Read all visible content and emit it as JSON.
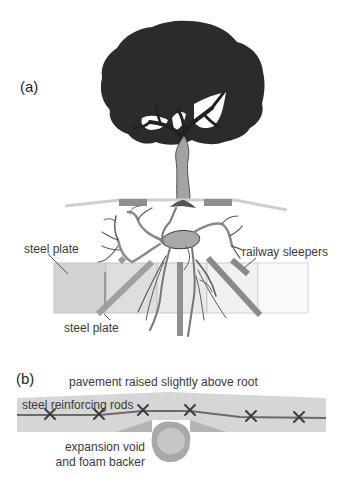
{
  "figure": {
    "panel_a": {
      "label": "(a)",
      "annotations": {
        "steel_plate_upper": "steel plate",
        "steel_plate_lower": "steel plate",
        "railway_sleepers": "railway sleepers"
      }
    },
    "panel_b": {
      "label": "(b)",
      "annotations": {
        "pavement": "pavement raised slightly above root",
        "rods": "steel reinforcing rods",
        "void_line1": "expansion void",
        "void_line2": "and foam backer"
      }
    },
    "colors": {
      "canopy": "#2b2b2b",
      "trunk": "#a3a3a3",
      "root": "#9a9a9a",
      "root_outline": "#4a4a4a",
      "plate_fill": "#cfcfcf",
      "sleeper": "#8c8c8c",
      "pavement": "#d6d6d6",
      "rod": "#6a6a6a",
      "text": "#3a3a3a"
    }
  }
}
